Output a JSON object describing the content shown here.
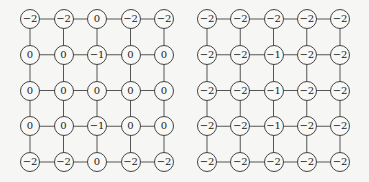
{
  "grids": [
    {
      "name": "left-grid",
      "origin": [
        30,
        19
      ],
      "pitch": [
        33.5,
        35.75
      ],
      "values": [
        [
          "−2",
          "−2",
          "0",
          "−2",
          "−2"
        ],
        [
          "0",
          "0",
          "−1",
          "0",
          "0"
        ],
        [
          "0",
          "0",
          "0",
          "0",
          "0"
        ],
        [
          "0",
          "0",
          "−1",
          "0",
          "0"
        ],
        [
          "−2",
          "−2",
          "0",
          "−2",
          "−2"
        ]
      ]
    },
    {
      "name": "right-grid",
      "origin": [
        207,
        19
      ],
      "pitch": [
        33.25,
        35.75
      ],
      "values": [
        [
          "−2",
          "−2",
          "−2",
          "−2",
          "−2"
        ],
        [
          "−2",
          "−2",
          "−1",
          "−2",
          "−2"
        ],
        [
          "−2",
          "−2",
          "−1",
          "−2",
          "−2"
        ],
        [
          "−2",
          "−2",
          "−1",
          "−2",
          "−2"
        ],
        [
          "−2",
          "−2",
          "−2",
          "−2",
          "−2"
        ]
      ]
    }
  ],
  "colors": {
    "edge": "#555555",
    "node_border": "#444444",
    "background": "#f6f6f4"
  }
}
